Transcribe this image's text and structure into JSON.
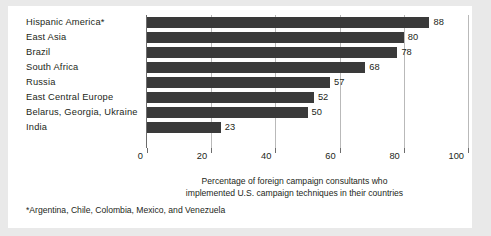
{
  "chart_data": {
    "type": "bar",
    "orientation": "horizontal",
    "title": "",
    "xlabel": "Percentage of foreign campaign consultants who implemented U.S. campaign techniques in their countries",
    "ylabel": "",
    "xlim": [
      0,
      100
    ],
    "grid": true,
    "legend": null,
    "categories": [
      "Hispanic America*",
      "East Asia",
      "Brazil",
      "South Africa",
      "Russia",
      "East Central Europe",
      "Belarus, Georgia, Ukraine",
      "India"
    ],
    "values": [
      88,
      80,
      78,
      68,
      57,
      52,
      50,
      23
    ],
    "value_labels": [
      "88",
      "80",
      "78",
      "68",
      "57",
      "52",
      "50",
      "23"
    ],
    "xticks": [
      0,
      20,
      40,
      60,
      80,
      100
    ],
    "xtick_labels": [
      "0",
      "20",
      "40",
      "60",
      "80",
      "100"
    ],
    "bar_color": "#3a3a3a",
    "gridline_color": "#b9b9b9",
    "axis_color": "#6d6d6d",
    "background_color": "#ffffff",
    "page_background_color": "#e9e9e9",
    "text_color": "#231f20"
  },
  "caption": {
    "line1": "Percentage of foreign campaign consultants who",
    "line2": "implemented U.S. campaign techniques in their countries"
  },
  "footnote": {
    "text": "*Argentina, Chile, Colombia, Mexico, and Venezuela"
  }
}
